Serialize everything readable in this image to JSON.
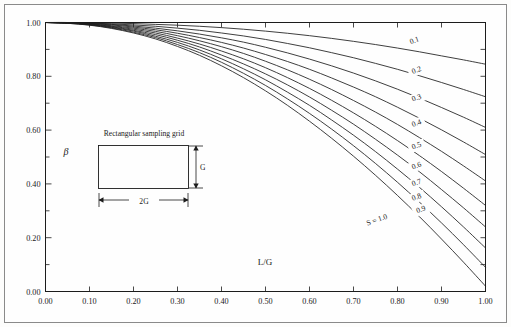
{
  "figure": {
    "name": "beta-vs-L-over-G-chart",
    "background_color": "#fefefe",
    "line_color": "#1c1c1c",
    "frame_color": "#8a8a8a"
  },
  "inset": {
    "title": "Rectangular sampling grid",
    "height_label": "G",
    "width_label": "2G"
  },
  "chart_data": {
    "type": "line",
    "title": "",
    "subtitle": "",
    "xlabel": "L/G",
    "ylabel": "β",
    "xlim": [
      0.0,
      1.0
    ],
    "ylim": [
      0.0,
      1.0
    ],
    "grid": false,
    "legend_position": "inline-curve-labels",
    "xticks": [
      0.0,
      0.1,
      0.2,
      0.3,
      0.4,
      0.5,
      0.6,
      0.7,
      0.8,
      0.9,
      1.0
    ],
    "xtick_labels": [
      "0.00",
      "0.10",
      "0.20",
      "0.30",
      "0.40",
      "0.50",
      "0.60",
      "0.70",
      "0.80",
      "0.90",
      "1.00"
    ],
    "yticks": [
      0.0,
      0.2,
      0.4,
      0.6,
      0.8,
      1.0
    ],
    "ytick_labels": [
      "0.00",
      "0.20",
      "0.40",
      "0.60",
      "0.80",
      "1.00"
    ],
    "yminorticks": [
      0.1,
      0.3,
      0.5,
      0.7,
      0.9
    ],
    "x": [
      0.0,
      0.05,
      0.1,
      0.15,
      0.2,
      0.25,
      0.3,
      0.35,
      0.4,
      0.45,
      0.5,
      0.55,
      0.6,
      0.65,
      0.7,
      0.75,
      0.8,
      0.85,
      0.9,
      0.95,
      1.0
    ],
    "series": [
      {
        "name": "0.1",
        "label": "0.1",
        "label_x": 0.84,
        "label_y": 0.925,
        "values": [
          1.0,
          1.0,
          0.999,
          0.998,
          0.996,
          0.993,
          0.99,
          0.986,
          0.981,
          0.975,
          0.968,
          0.96,
          0.951,
          0.941,
          0.93,
          0.918,
          0.905,
          0.891,
          0.876,
          0.861,
          0.845
        ]
      },
      {
        "name": "0.2",
        "label": "0.2",
        "label_x": 0.845,
        "label_y": 0.815,
        "values": [
          1.0,
          1.0,
          0.998,
          0.995,
          0.991,
          0.986,
          0.979,
          0.971,
          0.961,
          0.95,
          0.937,
          0.922,
          0.906,
          0.888,
          0.869,
          0.848,
          0.826,
          0.802,
          0.777,
          0.751,
          0.724
        ]
      },
      {
        "name": "0.3",
        "label": "0.3",
        "label_x": 0.845,
        "label_y": 0.712,
        "values": [
          1.0,
          0.999,
          0.997,
          0.993,
          0.987,
          0.979,
          0.969,
          0.957,
          0.943,
          0.927,
          0.908,
          0.887,
          0.864,
          0.839,
          0.812,
          0.783,
          0.752,
          0.719,
          0.684,
          0.648,
          0.61
        ]
      },
      {
        "name": "0.4",
        "label": "0.4",
        "label_x": 0.845,
        "label_y": 0.618,
        "values": [
          1.0,
          0.999,
          0.996,
          0.991,
          0.983,
          0.973,
          0.96,
          0.944,
          0.926,
          0.905,
          0.881,
          0.855,
          0.826,
          0.794,
          0.76,
          0.724,
          0.685,
          0.644,
          0.601,
          0.556,
          0.509
        ]
      },
      {
        "name": "0.5",
        "label": "0.5",
        "label_x": 0.845,
        "label_y": 0.534,
        "values": [
          1.0,
          0.999,
          0.995,
          0.988,
          0.979,
          0.967,
          0.951,
          0.932,
          0.91,
          0.885,
          0.856,
          0.824,
          0.789,
          0.751,
          0.71,
          0.667,
          0.621,
          0.572,
          0.521,
          0.467,
          0.411
        ]
      },
      {
        "name": "0.6",
        "label": "0.6",
        "label_x": 0.845,
        "label_y": 0.46,
        "values": [
          1.0,
          0.998,
          0.994,
          0.986,
          0.975,
          0.961,
          0.942,
          0.92,
          0.894,
          0.865,
          0.832,
          0.795,
          0.755,
          0.711,
          0.664,
          0.614,
          0.561,
          0.505,
          0.446,
          0.384,
          0.32
        ]
      },
      {
        "name": "0.7",
        "label": "0.7",
        "label_x": 0.845,
        "label_y": 0.397,
        "values": [
          1.0,
          0.998,
          0.993,
          0.984,
          0.971,
          0.955,
          0.934,
          0.909,
          0.879,
          0.846,
          0.809,
          0.768,
          0.723,
          0.674,
          0.622,
          0.566,
          0.507,
          0.445,
          0.379,
          0.311,
          0.24
        ]
      },
      {
        "name": "0.8",
        "label": "0.8",
        "label_x": 0.845,
        "label_y": 0.343,
        "values": [
          1.0,
          0.998,
          0.992,
          0.982,
          0.968,
          0.949,
          0.926,
          0.898,
          0.865,
          0.828,
          0.787,
          0.741,
          0.692,
          0.638,
          0.581,
          0.52,
          0.455,
          0.387,
          0.315,
          0.24,
          0.162
        ]
      },
      {
        "name": "0.9",
        "label": "0.9",
        "label_x": 0.855,
        "label_y": 0.297,
        "values": [
          1.0,
          0.997,
          0.991,
          0.98,
          0.964,
          0.944,
          0.918,
          0.888,
          0.852,
          0.811,
          0.766,
          0.716,
          0.662,
          0.604,
          0.542,
          0.476,
          0.406,
          0.332,
          0.255,
          0.174,
          0.09
        ]
      },
      {
        "name": "1.0",
        "label": "S = 1.0",
        "label_x": 0.755,
        "label_y": 0.258,
        "values": [
          1.0,
          0.997,
          0.99,
          0.978,
          0.961,
          0.939,
          0.911,
          0.878,
          0.839,
          0.795,
          0.746,
          0.692,
          0.633,
          0.57,
          0.503,
          0.432,
          0.357,
          0.278,
          0.195,
          0.109,
          0.02
        ]
      }
    ]
  }
}
